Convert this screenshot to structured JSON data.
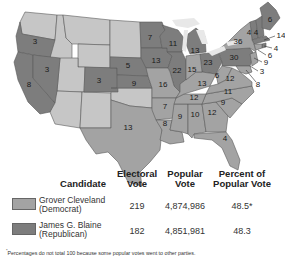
{
  "map": {
    "title": "Election of 1884",
    "colors": {
      "democrat": "#a3a3a3",
      "republican": "#7d7d7d",
      "territory": "#c6c6c6",
      "lakes": "#e8e8e8"
    },
    "labels": [
      {
        "state": "Oregon",
        "votes": "3",
        "party": "republican"
      },
      {
        "state": "California",
        "votes": "8",
        "party": "republican"
      },
      {
        "state": "Nevada",
        "votes": "3",
        "party": "republican"
      },
      {
        "state": "Colorado",
        "votes": "3",
        "party": "republican"
      },
      {
        "state": "Nebraska",
        "votes": "5",
        "party": "republican"
      },
      {
        "state": "Kansas",
        "votes": "9",
        "party": "republican"
      },
      {
        "state": "Texas",
        "votes": "13",
        "party": "democrat"
      },
      {
        "state": "Minnesota",
        "votes": "7",
        "party": "republican"
      },
      {
        "state": "Iowa",
        "votes": "13",
        "party": "republican"
      },
      {
        "state": "Missouri",
        "votes": "16",
        "party": "democrat"
      },
      {
        "state": "Arkansas",
        "votes": "7",
        "party": "democrat"
      },
      {
        "state": "Louisiana",
        "votes": "8",
        "party": "democrat"
      },
      {
        "state": "Wisconsin",
        "votes": "11",
        "party": "republican"
      },
      {
        "state": "Illinois",
        "votes": "22",
        "party": "republican"
      },
      {
        "state": "Michigan",
        "votes": "13",
        "party": "republican"
      },
      {
        "state": "Indiana",
        "votes": "15",
        "party": "democrat"
      },
      {
        "state": "Ohio",
        "votes": "23",
        "party": "republican"
      },
      {
        "state": "Kentucky",
        "votes": "13",
        "party": "democrat"
      },
      {
        "state": "Tennessee",
        "votes": "12",
        "party": "democrat"
      },
      {
        "state": "Mississippi",
        "votes": "9",
        "party": "democrat"
      },
      {
        "state": "Alabama",
        "votes": "10",
        "party": "democrat"
      },
      {
        "state": "Georgia",
        "votes": "12",
        "party": "democrat"
      },
      {
        "state": "Florida",
        "votes": "4",
        "party": "democrat"
      },
      {
        "state": "South Carolina",
        "votes": "9",
        "party": "democrat"
      },
      {
        "state": "North Carolina",
        "votes": "11",
        "party": "democrat"
      },
      {
        "state": "Virginia",
        "votes": "12",
        "party": "democrat"
      },
      {
        "state": "West Virginia",
        "votes": "6",
        "party": "democrat"
      },
      {
        "state": "Pennsylvania",
        "votes": "30",
        "party": "republican"
      },
      {
        "state": "New York",
        "votes": "36",
        "party": "democrat"
      },
      {
        "state": "Vermont",
        "votes": "4",
        "party": "republican"
      },
      {
        "state": "New Hampshire",
        "votes": "4",
        "party": "republican"
      },
      {
        "state": "Maine",
        "votes": "6",
        "party": "republican"
      },
      {
        "state": "Massachusetts",
        "votes": "14",
        "party": "republican"
      },
      {
        "state": "Rhode Island",
        "votes": "4",
        "party": "republican"
      },
      {
        "state": "Connecticut",
        "votes": "6",
        "party": "democrat"
      },
      {
        "state": "New Jersey",
        "votes": "9",
        "party": "democrat"
      },
      {
        "state": "Delaware",
        "votes": "3",
        "party": "democrat"
      },
      {
        "state": "Maryland",
        "votes": "8",
        "party": "democrat"
      }
    ]
  },
  "table": {
    "headers": {
      "candidate": "Candidate",
      "electoral": [
        "Electoral",
        "Vote"
      ],
      "popular": [
        "Popular",
        "Vote"
      ],
      "percent": [
        "Percent of",
        "Popular Vote"
      ]
    },
    "rows": [
      {
        "name": "Grover Cleveland",
        "party": "(Democrat)",
        "electoral": "219",
        "popular": "4,874,986",
        "percent": "48.5*",
        "swatch": "#a3a3a3"
      },
      {
        "name": "James G. Blaine",
        "party": "(Republican)",
        "electoral": "182",
        "popular": "4,851,981",
        "percent": "48.3",
        "swatch": "#7d7d7d"
      }
    ],
    "footnote_mark": "*",
    "footnote": "Percentages do not total 100 because some popular votes went to other parties."
  }
}
